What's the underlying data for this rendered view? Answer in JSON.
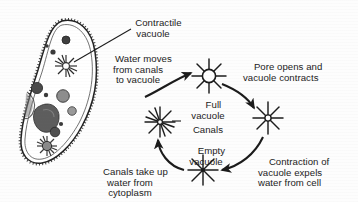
{
  "figure": {
    "background_color": "#fdfdfd",
    "ink_color": "#1b1b1b"
  },
  "cell": {
    "name": "ciliated protozoan cell",
    "organelles": [
      "contractile vacuole with radiating canals (upper)",
      "contractile vacuole with radiating canals (lower)",
      "macronucleus",
      "food vacuoles",
      "oral groove"
    ]
  },
  "labels": {
    "contractile_vacuole": "Contractile\nvacuole",
    "water_moves": "Water moves\nfrom canals\nto vacuole",
    "pore_opens": "Pore opens and\nvacuole contracts",
    "full_vacuole": "Full\nvacuole",
    "canals": "Canals",
    "empty_vacuole": "Empty\nvacuole",
    "contraction_expels": "Contraction of\nvacuole expels\nwater from cell",
    "canals_take_up": "Canals take up\nwater from\ncytoplasm"
  },
  "cycle": {
    "stages": [
      {
        "id": "full-vacuole",
        "label": "Full\nvacuole",
        "position": "top",
        "has_center_circle": true
      },
      {
        "id": "contracting-vacuole",
        "label": "",
        "position": "right",
        "has_center_circle": false
      },
      {
        "id": "empty-vacuole",
        "label": "Empty\nvacuole",
        "position": "bottom",
        "has_center_circle": false
      },
      {
        "id": "canals-vacuole",
        "label": "Canals",
        "position": "center-left",
        "has_center_circle": false
      }
    ],
    "arrows": [
      {
        "id": "arrow-to-full",
        "from": "canals",
        "to": "full-vacuole",
        "caption": "Water moves from canals to vacuole"
      },
      {
        "id": "arrow-full-to-contracting",
        "from": "full-vacuole",
        "to": "contracting-vacuole",
        "caption": "Pore opens and vacuole contracts"
      },
      {
        "id": "arrow-contracting-to-empty",
        "from": "contracting-vacuole",
        "to": "empty-vacuole",
        "caption": "Contraction of vacuole expels water from cell"
      },
      {
        "id": "arrow-empty-to-canals",
        "from": "empty-vacuole",
        "to": "canals",
        "caption": "Canals take up water from cytoplasm"
      }
    ]
  }
}
